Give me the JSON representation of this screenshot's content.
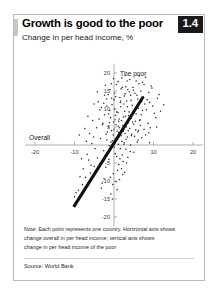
{
  "card": {
    "title": "Growth is good to the poor",
    "subtitle": "Change in per head income, %",
    "badge": "1.4"
  },
  "notes": {
    "line1": "Note: Each point represents one country. Horizontal axis shows",
    "line2": "change overall in per head income; vertical axis shows",
    "line3": "change in per head income of the poor",
    "source": "Source: World Bank"
  },
  "chart_data": {
    "type": "scatter",
    "title": "Growth is good to the poor",
    "subtitle": "Change in per head income, %",
    "xlabel": "Overall",
    "ylabel": "The poor",
    "xlim": [
      -22,
      22
    ],
    "ylim": [
      -22,
      22
    ],
    "xticks": [
      -20,
      -10,
      10,
      20
    ],
    "yticks": [
      20,
      15,
      10,
      5,
      -5,
      -10,
      -15,
      -20
    ],
    "xtick_labels": [
      "-20",
      "-10",
      "10",
      "20"
    ],
    "ytick_labels": [
      "20",
      "15",
      "10",
      "5",
      "-5",
      "-10",
      "-15",
      "-20"
    ],
    "grid": false,
    "legend": "none",
    "axis_origin": [
      0,
      0
    ],
    "accent_color": "#101010",
    "point_color": "#2e2e2e",
    "trend_line": {
      "type": "linear-fit",
      "x_start": -10.2,
      "y_start": -17.2,
      "x_end": 7.4,
      "y_end": 13.4
    },
    "points": [
      [
        -0.4,
        1.2
      ],
      [
        0.6,
        2.0
      ],
      [
        1.2,
        3.4
      ],
      [
        0.2,
        0.4
      ],
      [
        -1.0,
        -1.4
      ],
      [
        1.8,
        2.6
      ],
      [
        2.4,
        4.2
      ],
      [
        -1.6,
        -2.2
      ],
      [
        0.9,
        1.6
      ],
      [
        3.1,
        5.0
      ],
      [
        -2.2,
        -3.0
      ],
      [
        2.0,
        1.0
      ],
      [
        1.4,
        4.8
      ],
      [
        -0.8,
        0.8
      ],
      [
        0.1,
        -0.6
      ],
      [
        2.8,
        3.2
      ],
      [
        -3.0,
        -4.4
      ],
      [
        1.1,
        0.2
      ],
      [
        0.5,
        5.6
      ],
      [
        3.6,
        6.2
      ],
      [
        -1.2,
        -0.2
      ],
      [
        2.2,
        5.4
      ],
      [
        -0.2,
        2.8
      ],
      [
        1.6,
        -1.0
      ],
      [
        4.0,
        4.6
      ],
      [
        -2.6,
        -1.6
      ],
      [
        0.8,
        3.8
      ],
      [
        3.4,
        2.2
      ],
      [
        -0.6,
        4.0
      ],
      [
        1.9,
        6.8
      ],
      [
        2.6,
        0.6
      ],
      [
        -1.8,
        1.4
      ],
      [
        0.3,
        -2.4
      ],
      [
        4.4,
        7.4
      ],
      [
        -3.6,
        -5.2
      ],
      [
        1.3,
        7.2
      ],
      [
        2.9,
        8.0
      ],
      [
        -0.1,
        6.4
      ],
      [
        5.0,
        5.8
      ],
      [
        -4.2,
        -3.6
      ],
      [
        0.7,
        -3.2
      ],
      [
        3.8,
        9.2
      ],
      [
        -2.0,
        3.0
      ],
      [
        1.0,
        9.0
      ],
      [
        5.6,
        8.6
      ],
      [
        -5.0,
        -6.0
      ],
      [
        2.1,
        -2.8
      ],
      [
        6.2,
        10.2
      ],
      [
        -1.4,
        5.0
      ],
      [
        0.4,
        8.2
      ],
      [
        4.6,
        11.0
      ],
      [
        -6.0,
        -7.8
      ],
      [
        3.0,
        -1.2
      ],
      [
        1.7,
        10.6
      ],
      [
        7.0,
        12.0
      ],
      [
        -0.9,
        7.6
      ],
      [
        2.5,
        11.4
      ],
      [
        -7.2,
        -9.0
      ],
      [
        5.2,
        2.4
      ],
      [
        0.0,
        12.6
      ],
      [
        -2.8,
        6.0
      ],
      [
        6.6,
        7.0
      ],
      [
        1.5,
        13.2
      ],
      [
        -8.0,
        -11.0
      ],
      [
        3.2,
        12.2
      ],
      [
        4.2,
        0.0
      ],
      [
        -1.1,
        9.6
      ],
      [
        8.2,
        9.8
      ],
      [
        2.3,
        -4.6
      ],
      [
        -3.4,
        1.8
      ],
      [
        0.2,
        14.4
      ],
      [
        5.8,
        13.8
      ],
      [
        -9.0,
        -12.6
      ],
      [
        6.0,
        3.6
      ],
      [
        -0.5,
        11.2
      ],
      [
        3.9,
        14.8
      ],
      [
        1.2,
        -5.4
      ],
      [
        -4.8,
        -1.0
      ],
      [
        7.6,
        4.4
      ],
      [
        2.7,
        9.4
      ],
      [
        -2.4,
        8.4
      ],
      [
        4.8,
        16.0
      ],
      [
        0.9,
        -7.0
      ],
      [
        -6.4,
        -4.2
      ],
      [
        9.0,
        11.8
      ],
      [
        3.5,
        -3.4
      ],
      [
        -1.9,
        12.8
      ],
      [
        5.4,
        6.6
      ],
      [
        1.8,
        15.6
      ],
      [
        -10.0,
        -14.4
      ],
      [
        6.8,
        15.0
      ],
      [
        2.2,
        -8.2
      ],
      [
        -5.6,
        0.4
      ],
      [
        8.6,
        6.0
      ],
      [
        0.6,
        16.8
      ],
      [
        4.1,
        -1.8
      ],
      [
        -3.2,
        10.4
      ],
      [
        7.2,
        17.4
      ],
      [
        1.4,
        -9.6
      ],
      [
        -7.8,
        -6.6
      ],
      [
        10.2,
        8.8
      ],
      [
        3.3,
        17.8
      ],
      [
        -0.3,
        -11.0
      ],
      [
        5.9,
        0.8
      ],
      [
        -4.4,
        4.8
      ],
      [
        2.0,
        18.6
      ],
      [
        8.0,
        2.8
      ],
      [
        -1.5,
        14.0
      ],
      [
        6.4,
        19.2
      ],
      [
        0.8,
        -12.4
      ],
      [
        -8.6,
        -8.8
      ],
      [
        4.5,
        3.0
      ],
      [
        11.0,
        13.0
      ],
      [
        -2.1,
        -6.2
      ],
      [
        3.7,
        8.2
      ],
      [
        -0.7,
        17.0
      ],
      [
        9.4,
        16.4
      ],
      [
        1.1,
        5.2
      ],
      [
        -5.2,
        2.2
      ],
      [
        7.8,
        11.4
      ],
      [
        2.6,
        13.6
      ],
      [
        -1.3,
        -4.0
      ],
      [
        5.1,
        9.0
      ],
      [
        -3.8,
        7.2
      ],
      [
        6.1,
        1.4
      ],
      [
        0.1,
        10.0
      ],
      [
        -2.5,
        -9.4
      ],
      [
        4.3,
        12.4
      ],
      [
        8.8,
        14.6
      ],
      [
        -6.8,
        -2.6
      ],
      [
        1.6,
        11.8
      ],
      [
        3.0,
        16.2
      ],
      [
        -0.2,
        -8.0
      ],
      [
        5.5,
        4.2
      ],
      [
        -4.0,
        12.0
      ],
      [
        2.4,
        7.8
      ],
      [
        9.8,
        10.8
      ],
      [
        -1.7,
        3.6
      ],
      [
        6.9,
        8.4
      ],
      [
        0.5,
        -10.2
      ],
      [
        3.4,
        10.6
      ],
      [
        -9.6,
        -13.2
      ],
      [
        4.9,
        15.2
      ],
      [
        -2.9,
        5.6
      ],
      [
        7.4,
        13.4
      ],
      [
        1.3,
        2.2
      ],
      [
        -5.8,
        -5.6
      ],
      [
        10.6,
        7.6
      ],
      [
        2.8,
        14.2
      ],
      [
        -0.6,
        13.0
      ],
      [
        6.3,
        17.0
      ],
      [
        -3.6,
        9.8
      ],
      [
        4.7,
        6.4
      ],
      [
        1.9,
        -6.6
      ],
      [
        8.4,
        12.6
      ],
      [
        -7.0,
        1.0
      ],
      [
        3.6,
        4.0
      ],
      [
        -1.0,
        15.4
      ],
      [
        5.7,
        10.4
      ],
      [
        0.3,
        7.0
      ],
      [
        -4.6,
        -7.2
      ],
      [
        11.8,
        9.4
      ],
      [
        2.5,
        0.2
      ],
      [
        -2.2,
        16.6
      ],
      [
        6.7,
        5.4
      ],
      [
        9.2,
        4.8
      ],
      [
        -0.8,
        -13.6
      ],
      [
        4.0,
        18.2
      ],
      [
        1.7,
        12.2
      ],
      [
        -6.2,
        3.2
      ],
      [
        7.0,
        2.0
      ],
      [
        3.2,
        -5.0
      ],
      [
        -1.4,
        8.6
      ],
      [
        5.3,
        14.4
      ],
      [
        0.0,
        4.4
      ],
      [
        -3.0,
        -10.6
      ],
      [
        8.0,
        18.8
      ],
      [
        2.1,
        16.0
      ],
      [
        -5.4,
        6.8
      ],
      [
        12.6,
        11.2
      ],
      [
        4.4,
        2.6
      ],
      [
        -0.4,
        -15.0
      ],
      [
        6.5,
        6.8
      ],
      [
        1.0,
        17.6
      ],
      [
        -8.2,
        -3.8
      ],
      [
        3.8,
        7.4
      ],
      [
        9.6,
        15.8
      ],
      [
        -2.6,
        11.6
      ],
      [
        5.0,
        -2.0
      ],
      [
        2.9,
        19.4
      ],
      [
        -1.2,
        6.2
      ],
      [
        7.6,
        16.8
      ],
      [
        0.7,
        9.2
      ],
      [
        -4.2,
        14.8
      ],
      [
        10.8,
        5.0
      ],
      [
        4.2,
        13.8
      ],
      [
        -6.6,
        8.0
      ],
      [
        1.5,
        -3.8
      ],
      [
        8.8,
        3.4
      ],
      [
        -0.1,
        18.4
      ],
      [
        6.0,
        12.8
      ],
      [
        3.1,
        1.6
      ],
      [
        -3.2,
        -12.0
      ],
      [
        5.6,
        17.8
      ],
      [
        2.3,
        3.8
      ],
      [
        -7.4,
        4.6
      ],
      [
        11.4,
        14.0
      ],
      [
        0.4,
        13.4
      ],
      [
        -1.8,
        10.8
      ],
      [
        7.2,
        9.6
      ],
      [
        4.8,
        8.8
      ],
      [
        -5.0,
        11.4
      ],
      [
        2.7,
        -7.6
      ],
      [
        9.0,
        0.6
      ],
      [
        -2.4,
        13.8
      ],
      [
        1.2,
        6.6
      ],
      [
        6.2,
        4.0
      ],
      [
        -0.9,
        -9.0
      ],
      [
        3.5,
        15.4
      ],
      [
        -8.8,
        2.8
      ]
    ]
  }
}
